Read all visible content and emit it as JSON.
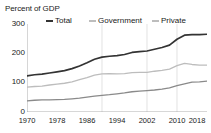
{
  "chart_data": {
    "type": "line",
    "title": "Percent of GDP",
    "xlabel": "",
    "ylabel": "Percent of GDP",
    "ylim": [
      0,
      300
    ],
    "xlim": [
      1970,
      2018
    ],
    "yticks": [
      300,
      200,
      100,
      0
    ],
    "xticks": [
      1970,
      1978,
      1986,
      1994,
      2002,
      2010,
      2018
    ],
    "grid": "vertical",
    "legend_position": "top",
    "x": [
      1970,
      1972,
      1974,
      1976,
      1978,
      1980,
      1982,
      1984,
      1986,
      1988,
      1990,
      1992,
      1994,
      1996,
      1998,
      2000,
      2002,
      2004,
      2006,
      2008,
      2010,
      2012,
      2014,
      2016,
      2018
    ],
    "series": [
      {
        "name": "Total",
        "color": "#333333",
        "values": [
          123,
          127,
          129,
          133,
          137,
          141,
          148,
          157,
          168,
          180,
          187,
          190,
          192,
          196,
          203,
          206,
          208,
          214,
          220,
          228,
          248,
          262,
          264,
          264,
          265
        ]
      },
      {
        "name": "Government",
        "color": "#bdbdbd",
        "values": [
          85,
          87,
          88,
          92,
          95,
          98,
          103,
          110,
          117,
          126,
          130,
          131,
          130,
          131,
          134,
          135,
          135,
          139,
          142,
          146,
          158,
          166,
          162,
          160,
          160
        ]
      },
      {
        "name": "Private",
        "color": "#8a8a8a",
        "values": [
          38,
          40,
          41,
          41,
          42,
          43,
          45,
          47,
          51,
          54,
          57,
          59,
          62,
          65,
          69,
          71,
          73,
          75,
          78,
          82,
          90,
          96,
          102,
          103,
          105
        ]
      }
    ],
    "gridline_years": [
      1990,
      2002,
      2010
    ]
  },
  "legend": {
    "items": [
      {
        "label": "Total"
      },
      {
        "label": "Government"
      },
      {
        "label": "Private"
      }
    ]
  },
  "axis": {
    "title": "Percent of GDP",
    "y_labels": [
      "300",
      "200",
      "100",
      "0"
    ],
    "x_labels": [
      "1970",
      "1978",
      "1986",
      "1994",
      "2002",
      "2010",
      "2018"
    ]
  }
}
